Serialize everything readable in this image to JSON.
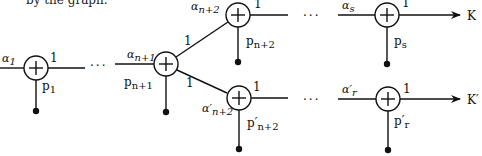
{
  "caption_fragment": "by the graph.",
  "colors": {
    "ink": "#111111",
    "background": "#ffffff"
  },
  "nodes": [
    {
      "id": "n1",
      "alpha": "α",
      "alpha_sub": "1",
      "weight": "1",
      "p": "p",
      "p_sub": "1"
    },
    {
      "id": "nn1",
      "alpha": "α",
      "alpha_sub": "n+1",
      "weight_up": "1",
      "weight_down": "1",
      "p": "p",
      "p_sub": "n+1"
    },
    {
      "id": "nn2",
      "alpha": "α",
      "alpha_sub": "n+2",
      "weight": "1",
      "p": "p",
      "p_sub": "n+2"
    },
    {
      "id": "nn2p",
      "alpha": "α′",
      "alpha_sub": "n+2",
      "weight": "1",
      "p": "p′",
      "p_sub": "n+2"
    },
    {
      "id": "ns",
      "alpha": "α",
      "alpha_sub": "s",
      "weight": "1",
      "p": "p",
      "p_sub": "s"
    },
    {
      "id": "nrp",
      "alpha": "α′",
      "alpha_sub": "r",
      "weight": "1",
      "p": "p′",
      "p_sub": "r"
    }
  ],
  "outputs": {
    "top": "K",
    "bottom": "K′"
  },
  "ellipsis": "···",
  "node_symbol": "+"
}
